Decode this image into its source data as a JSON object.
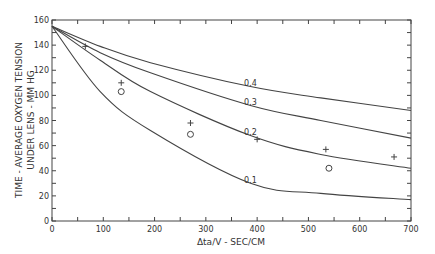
{
  "chart_data": {
    "type": "line",
    "title": "",
    "xlabel": "Δta/V - SEC/CM",
    "ylabel_line1": "TIME - AVERAGE OXYGEN TENSION",
    "ylabel_line2": "UNDER LENS - MM HG",
    "xlim": [
      0,
      700
    ],
    "ylim": [
      0,
      160
    ],
    "x_ticks": [
      0,
      100,
      200,
      300,
      400,
      500,
      600,
      700
    ],
    "y_ticks": [
      0,
      20,
      40,
      60,
      80,
      100,
      120,
      140,
      160
    ],
    "grid": false,
    "legend": "inline curve labels",
    "series": [
      {
        "name": "0.4",
        "x": [
          0,
          94,
          192,
          387,
          524,
          700
        ],
        "y": [
          155,
          139,
          126,
          107,
          98,
          88
        ]
      },
      {
        "name": "0.3",
        "x": [
          0,
          94,
          192,
          387,
          524,
          700
        ],
        "y": [
          155,
          134,
          118,
          92,
          80,
          66
        ]
      },
      {
        "name": "0.2",
        "x": [
          0,
          94,
          192,
          387,
          524,
          700
        ],
        "y": [
          155,
          128,
          103,
          68,
          53,
          42
        ]
      },
      {
        "name": "0.1",
        "x": [
          0,
          94,
          192,
          387,
          524,
          700
        ],
        "y": [
          155,
          103,
          72,
          30,
          22,
          17
        ]
      }
    ],
    "points_plus": {
      "x": [
        65,
        135,
        270,
        400,
        534,
        667
      ],
      "y": [
        139,
        110,
        78,
        65,
        57,
        51
      ]
    },
    "points_circle": {
      "x": [
        135,
        270,
        540
      ],
      "y": [
        103,
        69,
        42
      ]
    },
    "curve_labels": [
      {
        "text": "0.4",
        "x": 387,
        "y": 110
      },
      {
        "text": "0.3",
        "x": 387,
        "y": 95
      },
      {
        "text": "0.2",
        "x": 387,
        "y": 71
      },
      {
        "text": "0.1",
        "x": 387,
        "y": 33
      }
    ]
  }
}
